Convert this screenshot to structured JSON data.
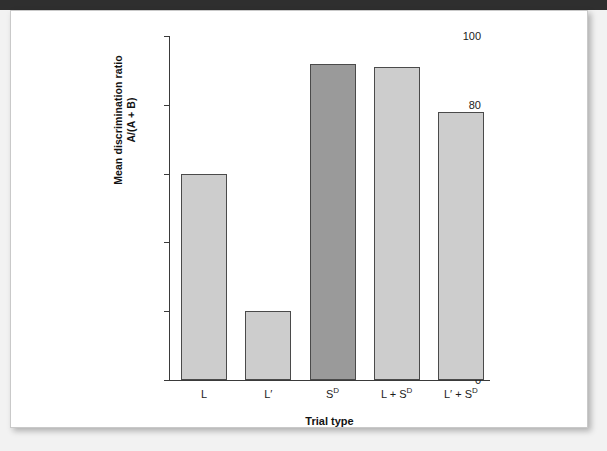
{
  "page": {
    "background_color": "#f2f2f2",
    "paper_color": "#ffffff",
    "scan_band_color": "#2f2f2f"
  },
  "chart_data": {
    "type": "bar",
    "title": "",
    "xlabel": "Trial type",
    "ylabel_line1": "Mean discrimination ratio",
    "ylabel_line2": "A/(A + B)",
    "categories": [
      "L",
      "L′",
      "Sᴰ",
      "L + Sᴰ",
      "L′ + Sᴰ"
    ],
    "category_html": [
      "L",
      "L′",
      "S<sup>D</sup>",
      "L + S<sup>D</sup>",
      "L′ + S<sup>D</sup>"
    ],
    "values": [
      60,
      20,
      92,
      91,
      78
    ],
    "bar_colors": [
      "#cdcdcd",
      "#cdcdcd",
      "#9a9a9a",
      "#cdcdcd",
      "#cdcdcd"
    ],
    "bar_border_color": "#4a4a4a",
    "ylim": [
      0,
      100
    ],
    "yticks": [
      0,
      20,
      40,
      60,
      80,
      100
    ],
    "ytick_labels": [
      "0",
      "20",
      "40",
      "60",
      "80",
      "100"
    ],
    "grid": false,
    "legend": false,
    "axis_color": "#3a3a3a"
  }
}
